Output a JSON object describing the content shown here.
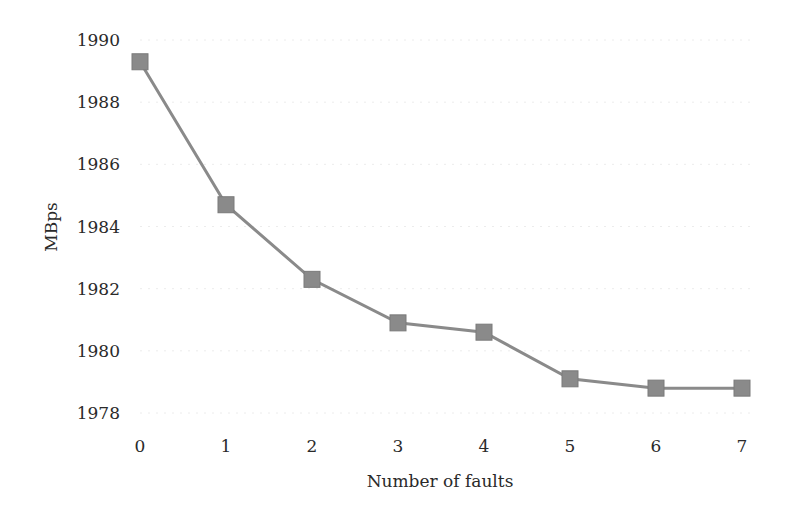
{
  "chart_data": {
    "type": "line",
    "title": "",
    "xlabel": "Number of faults",
    "ylabel": "MBps",
    "x": [
      0,
      1,
      2,
      3,
      4,
      5,
      6,
      7
    ],
    "x_tick_labels": [
      "0",
      "1",
      "2",
      "3",
      "4",
      "5",
      "6",
      "7"
    ],
    "y_tick_labels": [
      "1978",
      "1980",
      "1982",
      "1984",
      "1986",
      "1988",
      "1990"
    ],
    "ylim": [
      1978,
      1990
    ],
    "xlim": [
      0,
      7
    ],
    "grid": true,
    "legend": null,
    "series": [
      {
        "name": "MBps",
        "values": [
          1989.3,
          1984.7,
          1982.3,
          1980.9,
          1980.6,
          1979.1,
          1978.8,
          1978.8
        ],
        "marker": "square",
        "color": "#8a8a8a"
      }
    ]
  },
  "colors": {
    "line": "#8a8a8a",
    "marker": "#8a8a8a",
    "text": "#2a2a2a",
    "grid": "#ececec"
  }
}
